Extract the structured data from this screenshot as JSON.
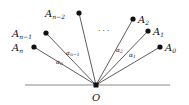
{
  "diagram": {
    "origin": {
      "label": "O"
    },
    "points": [
      {
        "id": "An",
        "base": "A",
        "sub": "n"
      },
      {
        "id": "An-1",
        "base": "A",
        "sub": "n−1"
      },
      {
        "id": "An-2",
        "base": "A",
        "sub": "n−2"
      },
      {
        "id": "A2",
        "base": "A",
        "sub": "2"
      },
      {
        "id": "A1",
        "base": "A",
        "sub": "1"
      },
      {
        "id": "A0",
        "base": "A",
        "sub": "0"
      }
    ],
    "ellipsis": "· · ·",
    "angles": [
      {
        "id": "alpha-n",
        "base": "α",
        "sub": "n"
      },
      {
        "id": "alpha-n-1",
        "base": "α",
        "sub": "n−1"
      },
      {
        "id": "alpha-2",
        "base": "α",
        "sub": "2"
      },
      {
        "id": "alpha-1",
        "base": "α",
        "sub": "1"
      }
    ]
  }
}
